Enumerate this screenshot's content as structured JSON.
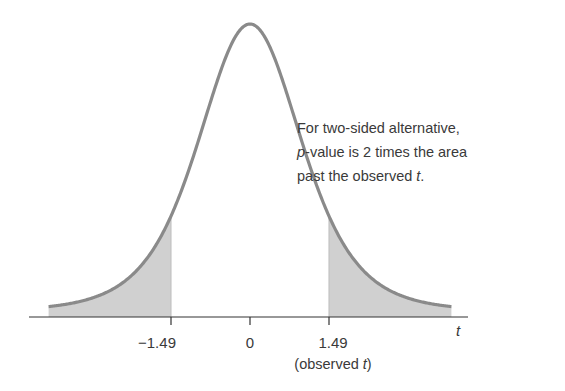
{
  "annotation": {
    "line1": "For two-sided alternative,",
    "line2_italic": "p",
    "line2_rest": "-value is 2 times the area",
    "line3_prefix": "past the observed ",
    "line3_italic": "t",
    "line3_suffix": "."
  },
  "axis": {
    "variable": "t",
    "ticks": [
      {
        "value": -1.49,
        "label": "−1.49"
      },
      {
        "value": 0,
        "label": "0"
      },
      {
        "value": 1.49,
        "label": "1.49"
      }
    ],
    "observed_label_prefix": "(observed ",
    "observed_label_italic": "t",
    "observed_label_suffix": ")"
  },
  "colors": {
    "curve": "#8a8a8a",
    "shade": "#d0d0d0",
    "axis": "#333333",
    "text": "#3a3a3a"
  },
  "chart_data": {
    "type": "area",
    "title": "",
    "xlabel": "t",
    "ylabel": "",
    "x_range": [
      -3.8,
      3.8
    ],
    "peak_at": 0,
    "shaded_regions": [
      {
        "from": -3.8,
        "to": -1.49
      },
      {
        "from": 1.49,
        "to": 3.8
      }
    ],
    "observed_t": 1.49,
    "tick_labels": [
      "−1.49",
      "0",
      "1.49"
    ],
    "annotations": [
      "For two-sided alternative, p-value is 2 times the area past the observed t.",
      "(observed t)"
    ]
  }
}
